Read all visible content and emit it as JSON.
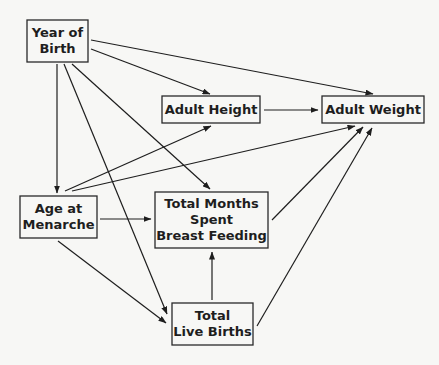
{
  "diagram": {
    "type": "path-diagram",
    "nodes": [
      {
        "id": "year_of_birth",
        "lines": [
          "Year of",
          "Birth"
        ]
      },
      {
        "id": "adult_height",
        "lines": [
          "Adult Height"
        ]
      },
      {
        "id": "adult_weight",
        "lines": [
          "Adult Weight"
        ]
      },
      {
        "id": "age_at_menarche",
        "lines": [
          "Age at",
          "Menarche"
        ]
      },
      {
        "id": "months_breast_feeding",
        "lines": [
          "Total Months",
          "Spent",
          "Breast Feeding"
        ]
      },
      {
        "id": "live_births",
        "lines": [
          "Total",
          "Live Births"
        ]
      }
    ],
    "edges": [
      {
        "from": "year_of_birth",
        "to": "adult_weight"
      },
      {
        "from": "year_of_birth",
        "to": "adult_height"
      },
      {
        "from": "year_of_birth",
        "to": "age_at_menarche"
      },
      {
        "from": "year_of_birth",
        "to": "live_births"
      },
      {
        "from": "year_of_birth",
        "to": "months_breast_feeding"
      },
      {
        "from": "adult_height",
        "to": "adult_weight"
      },
      {
        "from": "age_at_menarche",
        "to": "adult_height"
      },
      {
        "from": "age_at_menarche",
        "to": "adult_weight"
      },
      {
        "from": "age_at_menarche",
        "to": "months_breast_feeding"
      },
      {
        "from": "age_at_menarche",
        "to": "live_births"
      },
      {
        "from": "months_breast_feeding",
        "to": "adult_weight"
      },
      {
        "from": "live_births",
        "to": "months_breast_feeding"
      },
      {
        "from": "live_births",
        "to": "adult_weight"
      }
    ]
  }
}
